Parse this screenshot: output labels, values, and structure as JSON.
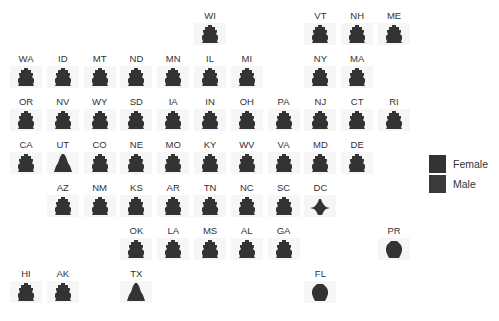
{
  "chart_data": {
    "type": "geofacet-population-pyramid",
    "title": "",
    "legend": [
      {
        "label": "Female",
        "color": "#333333"
      },
      {
        "label": "Male",
        "color": "#3a3a3a"
      }
    ],
    "grid": [
      {
        "state": "WI",
        "col": 6,
        "row": 1,
        "shape": "normal"
      },
      {
        "state": "VT",
        "col": 9,
        "row": 1,
        "shape": "normal"
      },
      {
        "state": "NH",
        "col": 10,
        "row": 1,
        "shape": "normal"
      },
      {
        "state": "ME",
        "col": 11,
        "row": 1,
        "shape": "normal"
      },
      {
        "state": "WA",
        "col": 1,
        "row": 2,
        "shape": "normal"
      },
      {
        "state": "ID",
        "col": 2,
        "row": 2,
        "shape": "normal"
      },
      {
        "state": "MT",
        "col": 3,
        "row": 2,
        "shape": "normal"
      },
      {
        "state": "ND",
        "col": 4,
        "row": 2,
        "shape": "normal"
      },
      {
        "state": "MN",
        "col": 5,
        "row": 2,
        "shape": "normal"
      },
      {
        "state": "IL",
        "col": 6,
        "row": 2,
        "shape": "normal"
      },
      {
        "state": "MI",
        "col": 7,
        "row": 2,
        "shape": "normal"
      },
      {
        "state": "NY",
        "col": 9,
        "row": 2,
        "shape": "normal"
      },
      {
        "state": "MA",
        "col": 10,
        "row": 2,
        "shape": "normal"
      },
      {
        "state": "OR",
        "col": 1,
        "row": 3,
        "shape": "normal"
      },
      {
        "state": "NV",
        "col": 2,
        "row": 3,
        "shape": "normal"
      },
      {
        "state": "WY",
        "col": 3,
        "row": 3,
        "shape": "normal"
      },
      {
        "state": "SD",
        "col": 4,
        "row": 3,
        "shape": "normal"
      },
      {
        "state": "IA",
        "col": 5,
        "row": 3,
        "shape": "normal"
      },
      {
        "state": "IN",
        "col": 6,
        "row": 3,
        "shape": "normal"
      },
      {
        "state": "OH",
        "col": 7,
        "row": 3,
        "shape": "normal"
      },
      {
        "state": "PA",
        "col": 8,
        "row": 3,
        "shape": "normal"
      },
      {
        "state": "NJ",
        "col": 9,
        "row": 3,
        "shape": "normal"
      },
      {
        "state": "CT",
        "col": 10,
        "row": 3,
        "shape": "normal"
      },
      {
        "state": "RI",
        "col": 11,
        "row": 3,
        "shape": "normal"
      },
      {
        "state": "CA",
        "col": 1,
        "row": 4,
        "shape": "normal"
      },
      {
        "state": "UT",
        "col": 2,
        "row": 4,
        "shape": "young"
      },
      {
        "state": "CO",
        "col": 3,
        "row": 4,
        "shape": "normal"
      },
      {
        "state": "NE",
        "col": 4,
        "row": 4,
        "shape": "normal"
      },
      {
        "state": "MO",
        "col": 5,
        "row": 4,
        "shape": "normal"
      },
      {
        "state": "KY",
        "col": 6,
        "row": 4,
        "shape": "normal"
      },
      {
        "state": "WV",
        "col": 7,
        "row": 4,
        "shape": "normal"
      },
      {
        "state": "VA",
        "col": 8,
        "row": 4,
        "shape": "normal"
      },
      {
        "state": "MD",
        "col": 9,
        "row": 4,
        "shape": "normal"
      },
      {
        "state": "DE",
        "col": 10,
        "row": 4,
        "shape": "normal"
      },
      {
        "state": "AZ",
        "col": 2,
        "row": 5,
        "shape": "normal"
      },
      {
        "state": "NM",
        "col": 3,
        "row": 5,
        "shape": "normal"
      },
      {
        "state": "KS",
        "col": 4,
        "row": 5,
        "shape": "normal"
      },
      {
        "state": "AR",
        "col": 5,
        "row": 5,
        "shape": "normal"
      },
      {
        "state": "TN",
        "col": 6,
        "row": 5,
        "shape": "normal"
      },
      {
        "state": "NC",
        "col": 7,
        "row": 5,
        "shape": "normal"
      },
      {
        "state": "SC",
        "col": 8,
        "row": 5,
        "shape": "normal"
      },
      {
        "state": "DC",
        "col": 9,
        "row": 5,
        "shape": "dc"
      },
      {
        "state": "OK",
        "col": 4,
        "row": 6,
        "shape": "normal"
      },
      {
        "state": "LA",
        "col": 5,
        "row": 6,
        "shape": "normal"
      },
      {
        "state": "MS",
        "col": 6,
        "row": 6,
        "shape": "normal"
      },
      {
        "state": "AL",
        "col": 7,
        "row": 6,
        "shape": "normal"
      },
      {
        "state": "GA",
        "col": 8,
        "row": 6,
        "shape": "normal"
      },
      {
        "state": "PR",
        "col": 11,
        "row": 6,
        "shape": "old"
      },
      {
        "state": "HI",
        "col": 1,
        "row": 7,
        "shape": "normal"
      },
      {
        "state": "AK",
        "col": 2,
        "row": 7,
        "shape": "normal"
      },
      {
        "state": "TX",
        "col": 4,
        "row": 7,
        "shape": "young"
      },
      {
        "state": "FL",
        "col": 9,
        "row": 7,
        "shape": "old"
      }
    ],
    "grid_on": false,
    "legend_position": "right"
  }
}
